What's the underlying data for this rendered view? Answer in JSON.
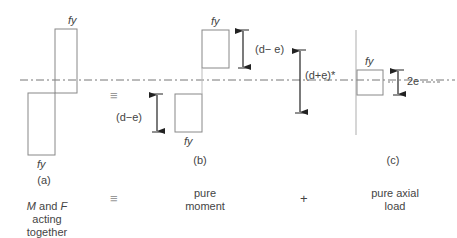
{
  "figure": {
    "panels": [
      {
        "id": "a",
        "label": "(a)",
        "caption_parts": [
          "M",
          " and ",
          "F"
        ],
        "caption_line2": "acting",
        "caption_line3": "together"
      },
      {
        "id": "b",
        "label": "(b)",
        "caption_line1": "pure",
        "caption_line2": "moment"
      },
      {
        "id": "c",
        "label": "(c)",
        "caption_line1": "pure axial",
        "caption_line2": "load"
      }
    ],
    "stress_label": "fy",
    "dimensions": {
      "b_left": "(d−e)",
      "b_right": "(d− e)",
      "combined": "(d+e)*",
      "c_axial": "2e"
    },
    "operators": {
      "equiv_top": "≡",
      "equiv_bottom": "≡",
      "plus": "+"
    }
  },
  "colors": {
    "line": "#888888",
    "arrow": "#222222",
    "divider": "#bbbbbb"
  }
}
